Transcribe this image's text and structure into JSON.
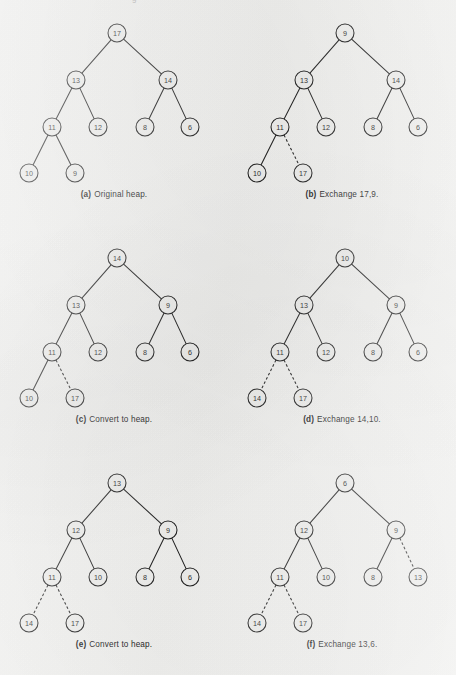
{
  "figure": {
    "background_color": "#f4f4f2",
    "ink_color": "#1d1d1d",
    "node_fill": "#f2f2f0",
    "top_cropped_text": "g",
    "layout": {
      "columns": 2,
      "rows": 3,
      "panel_width": 228,
      "panel_height": 225,
      "node_radius": 9
    },
    "levels_y": [
      33,
      80,
      127,
      173
    ],
    "panels": [
      {
        "id": "panel-a",
        "tag": "(a)",
        "caption": "Original heap.",
        "col": 0,
        "row": 0,
        "nodes": [
          {
            "id": "n0",
            "label": "17",
            "x": 117,
            "y": 33
          },
          {
            "id": "n1",
            "label": "13",
            "x": 76,
            "y": 80
          },
          {
            "id": "n2",
            "label": "14",
            "x": 168,
            "y": 80
          },
          {
            "id": "n3",
            "label": "11",
            "x": 52,
            "y": 127
          },
          {
            "id": "n4",
            "label": "12",
            "x": 98,
            "y": 127
          },
          {
            "id": "n5",
            "label": "8",
            "x": 145,
            "y": 127
          },
          {
            "id": "n6",
            "label": "6",
            "x": 190,
            "y": 127
          },
          {
            "id": "n7",
            "label": "10",
            "x": 29,
            "y": 173
          },
          {
            "id": "n8",
            "label": "9",
            "x": 75,
            "y": 173
          }
        ],
        "edges": [
          {
            "from": "n0",
            "to": "n1",
            "style": "solid"
          },
          {
            "from": "n0",
            "to": "n2",
            "style": "solid"
          },
          {
            "from": "n1",
            "to": "n3",
            "style": "solid"
          },
          {
            "from": "n1",
            "to": "n4",
            "style": "solid"
          },
          {
            "from": "n2",
            "to": "n5",
            "style": "solid"
          },
          {
            "from": "n2",
            "to": "n6",
            "style": "solid"
          },
          {
            "from": "n3",
            "to": "n7",
            "style": "solid"
          },
          {
            "from": "n3",
            "to": "n8",
            "style": "solid"
          }
        ]
      },
      {
        "id": "panel-b",
        "tag": "(b)",
        "caption": "Exchange 17,9.",
        "col": 1,
        "row": 0,
        "nodes": [
          {
            "id": "n0",
            "label": "9",
            "x": 117,
            "y": 33
          },
          {
            "id": "n1",
            "label": "13",
            "x": 76,
            "y": 80
          },
          {
            "id": "n2",
            "label": "14",
            "x": 168,
            "y": 80
          },
          {
            "id": "n3",
            "label": "11",
            "x": 52,
            "y": 127
          },
          {
            "id": "n4",
            "label": "12",
            "x": 98,
            "y": 127
          },
          {
            "id": "n5",
            "label": "8",
            "x": 145,
            "y": 127
          },
          {
            "id": "n6",
            "label": "6",
            "x": 190,
            "y": 127
          },
          {
            "id": "n7",
            "label": "10",
            "x": 29,
            "y": 173
          },
          {
            "id": "n8",
            "label": "17",
            "x": 75,
            "y": 173
          }
        ],
        "edges": [
          {
            "from": "n0",
            "to": "n1",
            "style": "solid"
          },
          {
            "from": "n0",
            "to": "n2",
            "style": "solid"
          },
          {
            "from": "n1",
            "to": "n3",
            "style": "solid"
          },
          {
            "from": "n1",
            "to": "n4",
            "style": "solid"
          },
          {
            "from": "n2",
            "to": "n5",
            "style": "solid"
          },
          {
            "from": "n2",
            "to": "n6",
            "style": "solid"
          },
          {
            "from": "n3",
            "to": "n7",
            "style": "solid"
          },
          {
            "from": "n3",
            "to": "n8",
            "style": "dashed"
          }
        ]
      },
      {
        "id": "panel-c",
        "tag": "(c)",
        "caption": "Convert to heap.",
        "col": 0,
        "row": 1,
        "nodes": [
          {
            "id": "n0",
            "label": "14",
            "x": 117,
            "y": 33
          },
          {
            "id": "n1",
            "label": "13",
            "x": 76,
            "y": 80
          },
          {
            "id": "n2",
            "label": "9",
            "x": 168,
            "y": 80
          },
          {
            "id": "n3",
            "label": "11",
            "x": 52,
            "y": 127
          },
          {
            "id": "n4",
            "label": "12",
            "x": 98,
            "y": 127
          },
          {
            "id": "n5",
            "label": "8",
            "x": 145,
            "y": 127
          },
          {
            "id": "n6",
            "label": "6",
            "x": 190,
            "y": 127
          },
          {
            "id": "n7",
            "label": "10",
            "x": 29,
            "y": 173
          },
          {
            "id": "n8",
            "label": "17",
            "x": 75,
            "y": 173
          }
        ],
        "edges": [
          {
            "from": "n0",
            "to": "n1",
            "style": "solid"
          },
          {
            "from": "n0",
            "to": "n2",
            "style": "solid"
          },
          {
            "from": "n1",
            "to": "n3",
            "style": "solid"
          },
          {
            "from": "n1",
            "to": "n4",
            "style": "solid"
          },
          {
            "from": "n2",
            "to": "n5",
            "style": "solid"
          },
          {
            "from": "n2",
            "to": "n6",
            "style": "solid"
          },
          {
            "from": "n3",
            "to": "n7",
            "style": "solid"
          },
          {
            "from": "n3",
            "to": "n8",
            "style": "dashed"
          }
        ]
      },
      {
        "id": "panel-d",
        "tag": "(d)",
        "caption": "Exchange 14,10.",
        "col": 1,
        "row": 1,
        "nodes": [
          {
            "id": "n0",
            "label": "10",
            "x": 117,
            "y": 33
          },
          {
            "id": "n1",
            "label": "13",
            "x": 76,
            "y": 80
          },
          {
            "id": "n2",
            "label": "9",
            "x": 168,
            "y": 80
          },
          {
            "id": "n3",
            "label": "11",
            "x": 52,
            "y": 127
          },
          {
            "id": "n4",
            "label": "12",
            "x": 98,
            "y": 127
          },
          {
            "id": "n5",
            "label": "8",
            "x": 145,
            "y": 127
          },
          {
            "id": "n6",
            "label": "6",
            "x": 190,
            "y": 127
          },
          {
            "id": "n7",
            "label": "14",
            "x": 29,
            "y": 173
          },
          {
            "id": "n8",
            "label": "17",
            "x": 75,
            "y": 173
          }
        ],
        "edges": [
          {
            "from": "n0",
            "to": "n1",
            "style": "solid"
          },
          {
            "from": "n0",
            "to": "n2",
            "style": "solid"
          },
          {
            "from": "n1",
            "to": "n3",
            "style": "solid"
          },
          {
            "from": "n1",
            "to": "n4",
            "style": "solid"
          },
          {
            "from": "n2",
            "to": "n5",
            "style": "solid"
          },
          {
            "from": "n2",
            "to": "n6",
            "style": "solid"
          },
          {
            "from": "n3",
            "to": "n7",
            "style": "dashed"
          },
          {
            "from": "n3",
            "to": "n8",
            "style": "dashed"
          }
        ]
      },
      {
        "id": "panel-e",
        "tag": "(e)",
        "caption": "Convert to heap.",
        "col": 0,
        "row": 2,
        "nodes": [
          {
            "id": "n0",
            "label": "13",
            "x": 117,
            "y": 33
          },
          {
            "id": "n1",
            "label": "12",
            "x": 76,
            "y": 80
          },
          {
            "id": "n2",
            "label": "9",
            "x": 168,
            "y": 80
          },
          {
            "id": "n3",
            "label": "11",
            "x": 52,
            "y": 127
          },
          {
            "id": "n4",
            "label": "10",
            "x": 98,
            "y": 127
          },
          {
            "id": "n5",
            "label": "8",
            "x": 145,
            "y": 127
          },
          {
            "id": "n6",
            "label": "6",
            "x": 190,
            "y": 127
          },
          {
            "id": "n7",
            "label": "14",
            "x": 29,
            "y": 173
          },
          {
            "id": "n8",
            "label": "17",
            "x": 75,
            "y": 173
          }
        ],
        "edges": [
          {
            "from": "n0",
            "to": "n1",
            "style": "solid"
          },
          {
            "from": "n0",
            "to": "n2",
            "style": "solid"
          },
          {
            "from": "n1",
            "to": "n3",
            "style": "solid"
          },
          {
            "from": "n1",
            "to": "n4",
            "style": "solid"
          },
          {
            "from": "n2",
            "to": "n5",
            "style": "solid"
          },
          {
            "from": "n2",
            "to": "n6",
            "style": "solid"
          },
          {
            "from": "n3",
            "to": "n7",
            "style": "dashed"
          },
          {
            "from": "n3",
            "to": "n8",
            "style": "dashed"
          }
        ]
      },
      {
        "id": "panel-f",
        "tag": "(f)",
        "caption": "Exchange 13,6.",
        "col": 1,
        "row": 2,
        "nodes": [
          {
            "id": "n0",
            "label": "6",
            "x": 117,
            "y": 33
          },
          {
            "id": "n1",
            "label": "12",
            "x": 76,
            "y": 80
          },
          {
            "id": "n2",
            "label": "9",
            "x": 168,
            "y": 80
          },
          {
            "id": "n3",
            "label": "11",
            "x": 52,
            "y": 127
          },
          {
            "id": "n4",
            "label": "10",
            "x": 98,
            "y": 127
          },
          {
            "id": "n5",
            "label": "8",
            "x": 145,
            "y": 127
          },
          {
            "id": "n6",
            "label": "13",
            "x": 190,
            "y": 127
          },
          {
            "id": "n7",
            "label": "14",
            "x": 29,
            "y": 173
          },
          {
            "id": "n8",
            "label": "17",
            "x": 75,
            "y": 173
          }
        ],
        "edges": [
          {
            "from": "n0",
            "to": "n1",
            "style": "solid"
          },
          {
            "from": "n0",
            "to": "n2",
            "style": "solid"
          },
          {
            "from": "n1",
            "to": "n3",
            "style": "solid"
          },
          {
            "from": "n1",
            "to": "n4",
            "style": "solid"
          },
          {
            "from": "n2",
            "to": "n5",
            "style": "solid"
          },
          {
            "from": "n2",
            "to": "n6",
            "style": "dashed"
          },
          {
            "from": "n3",
            "to": "n7",
            "style": "dashed"
          },
          {
            "from": "n3",
            "to": "n8",
            "style": "dashed"
          }
        ]
      }
    ]
  }
}
